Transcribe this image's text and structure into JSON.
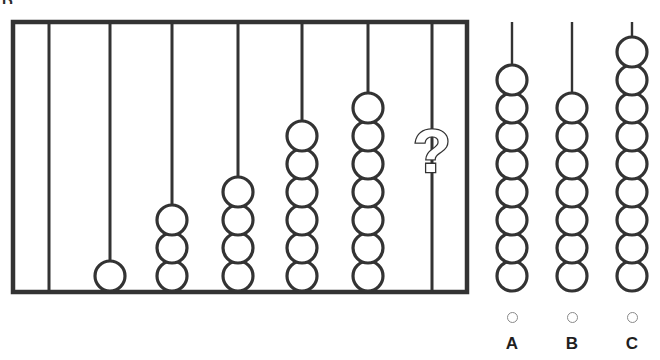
{
  "question": {
    "corner_label": "D.",
    "type": "pattern-sequence",
    "prompt_marker": "?"
  },
  "colors": {
    "ink": "#333333",
    "label_ink": "#1f1f1f",
    "radio_border": "#8a8a8a",
    "background": "#ffffff"
  },
  "abacus": {
    "frame": {
      "x": 13,
      "y": 22,
      "width": 454,
      "height": 270
    },
    "rods": [
      {
        "index": 0,
        "beads": 0,
        "x": 49
      },
      {
        "index": 1,
        "beads": 1,
        "x": 110
      },
      {
        "index": 2,
        "beads": 3,
        "x": 172
      },
      {
        "index": 3,
        "beads": 4,
        "x": 238
      },
      {
        "index": 4,
        "beads": 6,
        "x": 302
      },
      {
        "index": 5,
        "beads": 7,
        "x": 368
      },
      {
        "index": 6,
        "beads": null,
        "x": 432,
        "marker": "?"
      }
    ],
    "bead_radius": 15,
    "sequence_values": [
      0,
      1,
      3,
      4,
      6,
      7
    ]
  },
  "options": [
    {
      "id": "A",
      "label": "A",
      "beads": 8,
      "x": 512,
      "selected": false
    },
    {
      "id": "B",
      "label": "B",
      "beads": 7,
      "x": 572,
      "selected": false
    },
    {
      "id": "C",
      "label": "C",
      "beads": 9,
      "x": 632,
      "selected": false
    }
  ],
  "chart_data": {
    "type": "bar",
    "categories": [
      "1",
      "2",
      "3",
      "4",
      "5",
      "6",
      "7"
    ],
    "values": [
      0,
      1,
      3,
      4,
      6,
      7,
      null
    ],
    "xlabel": "Rod",
    "ylabel": "Beads",
    "ylim": [
      0,
      9
    ],
    "annotations": [
      "?"
    ],
    "legend": []
  }
}
